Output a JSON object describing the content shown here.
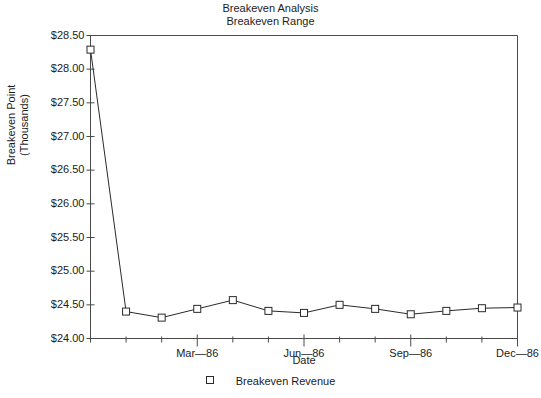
{
  "chart_data": {
    "type": "line",
    "title": "Breakeven Analysis",
    "subtitle": "Breakeven Range",
    "xlabel": "Date",
    "ylabel_line1": "Breakeven Point",
    "ylabel_line2": "(Thousands)",
    "ylim": [
      24.0,
      28.5
    ],
    "ytick_labels": [
      "$28.50",
      "$28.00",
      "$27.50",
      "$27.00",
      "$26.50",
      "$26.00",
      "$25.50",
      "$25.00",
      "$24.50",
      "$24.00"
    ],
    "ytick_values": [
      28.5,
      28.0,
      27.5,
      27.0,
      26.5,
      26.0,
      25.5,
      25.0,
      24.5,
      24.0
    ],
    "xtick_labels": [
      "Mar—86",
      "Jun—86",
      "Sep—86",
      "Dec—86"
    ],
    "xtick_indices": [
      3,
      6,
      9,
      12
    ],
    "x_index_count": 13,
    "grid": false,
    "legend_position": "bottom",
    "series": [
      {
        "name": "Breakeven Revenue",
        "marker": "open-square",
        "color": "#2a2a2a",
        "x": [
          0,
          1,
          2,
          3,
          4,
          5,
          6,
          7,
          8,
          9,
          10,
          11,
          12
        ],
        "values": [
          28.29,
          24.4,
          24.31,
          24.44,
          24.57,
          24.41,
          24.38,
          24.5,
          24.44,
          24.36,
          24.41,
          24.45,
          24.46
        ]
      }
    ]
  },
  "legend": {
    "entry_label": "Breakeven Revenue"
  }
}
